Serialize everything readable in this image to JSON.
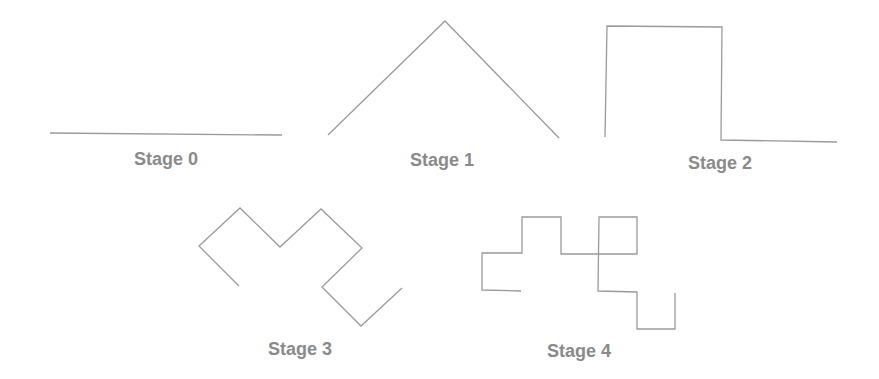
{
  "figure": {
    "line_color": "#9a9a9a",
    "label_color": "#8a8a8a",
    "stages": [
      {
        "label": "Stage 0",
        "label_x": 166,
        "label_y": 149,
        "points": "50,133 282,135"
      },
      {
        "label": "Stage 1",
        "label_x": 442,
        "label_y": 150,
        "points": "328,135 445,21 559,138"
      },
      {
        "label": "Stage 2",
        "label_x": 720,
        "label_y": 153,
        "points": "605,137 607,26 722,27 721,140 837,142"
      },
      {
        "label": "Stage 3",
        "label_x": 300,
        "label_y": 339,
        "points": "239,286 199,246 240,208 280,247 321,209 362,248 322,287 361,326 402,288"
      },
      {
        "label": "Stage 4",
        "label_x": 579,
        "label_y": 341,
        "points": "521,291 482,290 482,253 522,253 522,217 561,217 561,254 637,254 637,217 599,217 598,291 637,292 637,329 675,329 675,293"
      }
    ]
  }
}
